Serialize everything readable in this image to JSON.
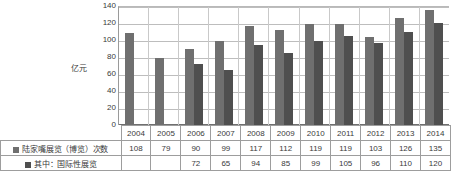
{
  "chart_data": {
    "type": "bar",
    "title": "",
    "xlabel": "",
    "ylabel": "亿元",
    "ylim": [
      0,
      140
    ],
    "ytick_step": 20,
    "yticks": [
      140,
      120,
      100,
      80,
      60,
      40,
      20,
      0
    ],
    "grid": true,
    "legend_position": "table-below",
    "categories": [
      "2004",
      "2005",
      "2006",
      "2007",
      "2008",
      "2009",
      "2010",
      "2011",
      "2012",
      "2013",
      "2014"
    ],
    "series": [
      {
        "name": "陆家嘴展览（博览）次数",
        "color": "#6f6f6f",
        "values": [
          108,
          79,
          90,
          99,
          117,
          112,
          119,
          119,
          103,
          126,
          135
        ]
      },
      {
        "name": "其中：国际性展览",
        "color": "#4f4f4f",
        "values": [
          null,
          null,
          72,
          65,
          94,
          85,
          99,
          105,
          96,
          110,
          120
        ]
      }
    ]
  },
  "axis": {
    "y_title": "亿元"
  },
  "table": {
    "blank_corner": "",
    "rows": [
      {
        "label": "陆家嘴展览（博览）次数",
        "cells": [
          "108",
          "79",
          "90",
          "99",
          "117",
          "112",
          "119",
          "119",
          "103",
          "126",
          "135"
        ]
      },
      {
        "label": "其中：国际性展览",
        "cells": [
          "",
          "",
          "72",
          "65",
          "94",
          "85",
          "99",
          "105",
          "96",
          "110",
          "120"
        ]
      }
    ]
  },
  "colors": {
    "series1": "#6f6f6f",
    "series2": "#4f4f4f",
    "grid": "#bdbdbd",
    "border": "#9d9d9d",
    "text": "#3a3a3a"
  }
}
